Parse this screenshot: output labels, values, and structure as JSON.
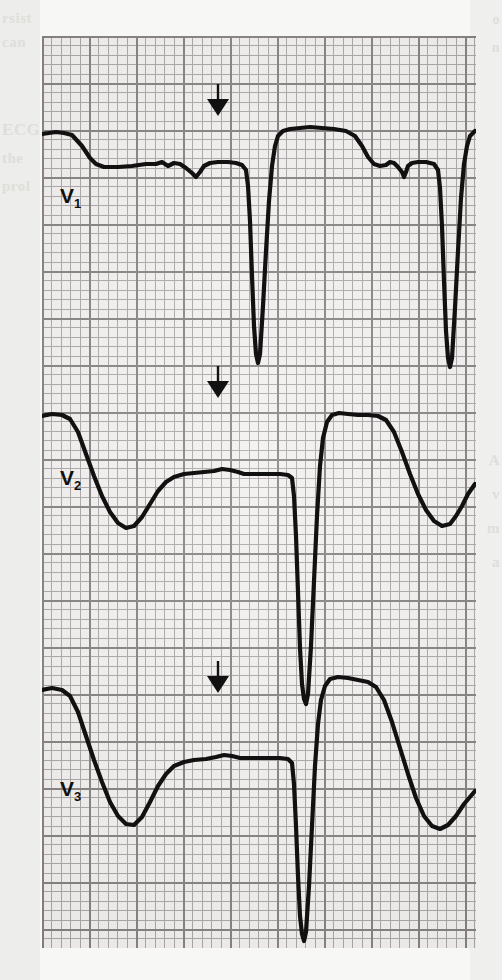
{
  "figure": {
    "kind": "ecg-strip",
    "paper_bg": "#f2f0ee",
    "grid_major_color": "#6e6a6b",
    "grid_minor_color": "#9b9799",
    "trace_color": "#111111",
    "grid": {
      "small_box_px": 9.4,
      "large_box_px": 47.0,
      "x": 42,
      "y": 36,
      "width": 434,
      "height": 912
    }
  },
  "leads": [
    {
      "id": "v1",
      "label": "V",
      "sub": "1",
      "label_x": 18,
      "label_y": 148,
      "baseline_y": 130,
      "marker": {
        "name": "down-arrow-marker",
        "x": 176,
        "y": 48
      },
      "path": "M0,98 L14,96 L22,97 L30,99 L40,110 L48,122 L54,128 L62,131 L76,131 L90,130 L104,128 L114,128 L120,126 L126,130 L132,127 L138,128 L144,132 L150,137 L154,141 L158,136 L162,130 L168,127 L176,126 L186,126 L194,127 L200,129 L204,134 L206,150 L208,185 L210,240 L212,290 L214,318 L216,327 L218,318 L221,270 L224,215 L227,165 L230,130 L233,110 L236,100 L241,95 L248,93 L258,92 L268,91 L280,92 L292,93 L304,95 L313,100 L320,110 L326,121 L332,128 L338,130 L344,129 L348,126 L352,127 L356,131 L360,136 L362,141 L364,136 L366,130 L370,127 L376,126 L384,126 L392,128 L396,134 L398,152 L400,190 L402,245 L404,295 L406,322 L408,331 L410,322 L413,272 L416,215 L419,162 L422,128 L425,110 L428,100 L433,95"
    },
    {
      "id": "v2",
      "label": "V",
      "sub": "2",
      "label_x": 18,
      "label_y": 430,
      "baseline_y": 404,
      "marker": {
        "name": "down-arrow-marker",
        "x": 176,
        "y": 330
      },
      "path": "M0,380 L10,378 L20,379 L28,383 L36,396 L44,418 L52,440 L60,460 L68,476 L76,487 L84,492 L92,490 L100,481 L108,468 L116,455 L124,446 L132,441 L142,438 L152,437 L162,436 L172,435 L180,433 L188,434 L196,436 L202,438 L210,438 L218,438 L228,438 L238,438 L246,439 L250,442 L252,460 L254,500 L256,556 L258,612 L260,648 L262,663 L264,668 L266,658 L269,610 L272,545 L275,480 L278,430 L281,402 L285,386 L290,379 L297,377 L306,378 L316,379 L326,379 L336,380 L344,384 L352,396 L360,416 L368,438 L376,458 L384,474 L392,485 L400,490 L408,488 L414,480 L420,470 L426,458 L433,448"
    },
    {
      "id": "v3",
      "label": "V",
      "sub": "3",
      "label_x": 18,
      "label_y": 741,
      "baseline_y": 678,
      "marker": {
        "name": "down-arrow-marker",
        "x": 176,
        "y": 625
      },
      "path": "M0,654 L10,652 L20,654 L28,660 L36,676 L44,700 L52,724 L60,746 L68,766 L76,780 L84,788 L92,789 L100,781 L108,766 L116,750 L124,738 L132,730 L142,726 L152,724 L164,723 L174,721 L182,719 L190,720 L198,722 L206,722 L216,722 L228,722 L238,722 L246,723 L250,727 L252,748 L254,790 L256,840 L258,880 L260,898 L262,905 L264,896 L267,850 L270,790 L273,730 L276,688 L279,664 L283,650 L288,643 L296,641 L306,642 L316,644 L326,646 L334,651 L342,664 L350,686 L358,712 L366,738 L374,762 L382,780 L390,790 L398,793 L406,789 L414,780 L422,768 L433,755"
    }
  ],
  "bleed_text": {
    "left": [
      "rsist",
      "can",
      "ECG",
      "the",
      "prol"
    ],
    "right": [
      "o",
      "n",
      "A",
      "v",
      "m",
      "a"
    ]
  }
}
